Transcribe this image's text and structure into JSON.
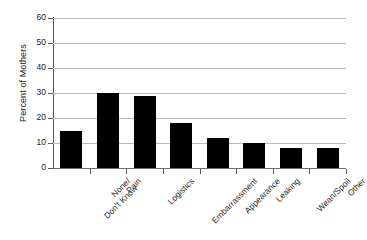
{
  "chart_data": {
    "type": "bar",
    "title": "",
    "subtitle": "",
    "xlabel": "",
    "ylabel": "Percent of Mothers",
    "ylim": [
      0,
      60
    ],
    "yticks": [
      0,
      10,
      20,
      30,
      40,
      50,
      60
    ],
    "ytick_labels": [
      "0",
      "10",
      "20",
      "30",
      "40",
      "50",
      "60"
    ],
    "grid": "horizontal",
    "legend": "none",
    "orientation": "vertical",
    "bar_color": "#000000",
    "gridline_color": "#b9b9b9",
    "axis_color": "#5a5a5a",
    "categories": [
      "None/\nDon't Know",
      "Pain",
      "Logistics",
      "Embarrassment",
      "Appearance",
      "Leaking",
      "Wean/Spoil",
      "Other"
    ],
    "category_lines": [
      [
        "None/",
        "Don't Know"
      ],
      [
        "Pain"
      ],
      [
        "Logistics"
      ],
      [
        "Embarrassment"
      ],
      [
        "Appearance"
      ],
      [
        "Leaking"
      ],
      [
        "Wean/Spoil"
      ],
      [
        "Other"
      ]
    ],
    "values": [
      15,
      30,
      29,
      18,
      12,
      10,
      8,
      8
    ]
  }
}
